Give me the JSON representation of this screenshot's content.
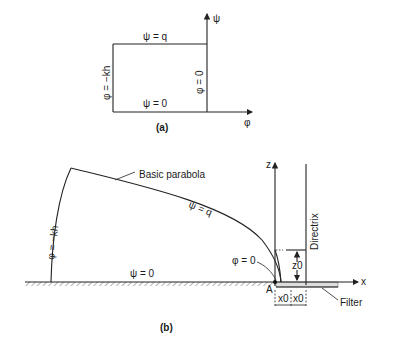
{
  "figure_a": {
    "caption": "(a)",
    "axis_vertical_label": "ψ",
    "axis_horizontal_label": "φ",
    "top_edge_label": "ψ = q",
    "bottom_edge_label": "ψ = 0",
    "left_edge_label": "φ = −kh",
    "right_edge_label": "φ = 0"
  },
  "figure_b": {
    "caption": "(b)",
    "curve_label": "Basic parabola",
    "top_streamline_label": "ψ = q",
    "bottom_streamline_label": "ψ = 0",
    "left_equipotential_label": "φ = −kh",
    "exit_equipotential_label": "φ = 0",
    "z_axis_label": "z",
    "x_axis_label": "x",
    "directrix_label": "Directrix",
    "z0_label": "z0",
    "x0_left_label": "x0",
    "x0_right_label": "x0",
    "point_label": "A",
    "filter_label": "Filter"
  }
}
